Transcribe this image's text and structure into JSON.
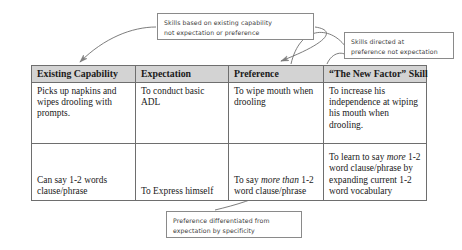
{
  "diagram": {
    "colors": {
      "header_fill": "#d3d3d3",
      "table_border": "#6e6e6e",
      "callout_border": "#8a8a8a",
      "arrow_fill": "#808080",
      "connector_stroke": "#6e6e6e",
      "text": "#1a1a1a",
      "callout_text": "#3b3b3b"
    }
  },
  "callouts": [
    {
      "id": "capability",
      "line1": "Skills based on existing capability",
      "line2": "not expectation or preference"
    },
    {
      "id": "preference",
      "line1": "Skills directed at",
      "line2": "preference not expectation"
    },
    {
      "id": "specificity",
      "line1": "Preference differentiated from",
      "line2": "expectation by specificity"
    }
  ],
  "table": {
    "headers": [
      "Existing Capability",
      "Expectation",
      "Preference",
      "“The New Factor” Skill"
    ],
    "rows": [
      {
        "existing_capability": "Picks up napkins and wipes drooling with prompts.",
        "expectation": "To conduct basic ADL",
        "preference": "To wipe mouth when drooling",
        "new_factor_skill": "To increase his independence at wiping his mouth when drooling."
      },
      {
        "existing_capability": "Can say 1-2 words clause/phrase",
        "expectation": "To Express himself",
        "preference_pre": "To say ",
        "preference_em": "more than",
        "preference_post": " 1-2 word clause/phrase",
        "skill_pre": "To learn to say ",
        "skill_em": "more",
        "skill_post": " 1-2 word clause/phrase by expanding current 1-2 word vocabulary"
      }
    ]
  }
}
